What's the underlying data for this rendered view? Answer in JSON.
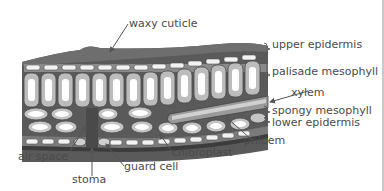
{
  "diagram": {
    "labels": {
      "waxy_cuticle": "waxy cuticle",
      "upper_epidermis": "upper epidermis",
      "palisade_mesophyll": "palisade mesophyll",
      "xylem": "xylem",
      "spongy_mesophyll": "spongy mesophyll",
      "lower_epidermis": "lower epidermis",
      "phloem": "phloem",
      "chloroplast": "chloroplast",
      "guard_cell": "guard cell",
      "stoma": "stoma",
      "air_space": "air space"
    },
    "colors": {
      "cuticle": "#6e6e6e",
      "cell_wall": "#7a7a7a",
      "cell_fill": "#d9d9d9",
      "vacuole": "#ffffff",
      "dark": "#3c3c3c",
      "text": "#4a4a4a"
    }
  }
}
